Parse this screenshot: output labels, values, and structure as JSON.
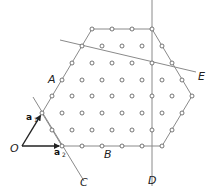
{
  "figure": {
    "colors": {
      "line": "#8a8a8a",
      "dot_stroke": "#555555",
      "arrow": "#222222",
      "text": "#222222"
    },
    "labels": {
      "O": "O",
      "A": "A",
      "B": "B",
      "C": "C",
      "D": "D",
      "E": "E",
      "a1": "a",
      "a1_sub": "1",
      "a2": "a",
      "a2_sub": "2"
    },
    "origin": [
      22,
      146
    ],
    "vectors": {
      "a1": [
        42,
        113
      ],
      "a2": [
        62,
        146
      ]
    },
    "hexagon": [
      [
        42,
        113
      ],
      [
        92,
        29
      ],
      [
        152,
        29
      ],
      [
        192,
        96
      ],
      [
        162,
        146
      ],
      [
        62,
        146
      ]
    ],
    "lines": {
      "C": [
        [
          33,
          97
        ],
        [
          84,
          181
        ]
      ],
      "D": [
        [
          152,
          0
        ],
        [
          152,
          186
        ]
      ],
      "E": [
        [
          60,
          40
        ],
        [
          196,
          72
        ]
      ]
    },
    "dot_rows": [
      {
        "y": 29,
        "x": [
          92,
          112,
          132,
          152
        ]
      },
      {
        "y": 46,
        "x": [
          82,
          102,
          122,
          142,
          162
        ]
      },
      {
        "y": 63,
        "x": [
          72,
          92,
          112,
          132,
          152,
          172
        ]
      },
      {
        "y": 80,
        "x": [
          62,
          82,
          102,
          122,
          142,
          162,
          182
        ]
      },
      {
        "y": 96,
        "x": [
          52,
          72,
          92,
          112,
          132,
          152,
          172,
          192
        ]
      },
      {
        "y": 113,
        "x": [
          42,
          62,
          82,
          102,
          122,
          142,
          162,
          182
        ]
      },
      {
        "y": 130,
        "x": [
          52,
          72,
          92,
          112,
          132,
          152,
          172
        ]
      },
      {
        "y": 146,
        "x": [
          62,
          82,
          102,
          122,
          142,
          162
        ]
      }
    ]
  }
}
